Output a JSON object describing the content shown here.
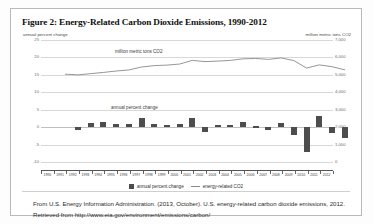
{
  "figure": {
    "title": "Figure 2: Energy-Related Carbon Dioxide Emissions, 1990-2012",
    "left_axis_caption": "annual percent change",
    "right_axis_caption": "million metric tons CO2",
    "caption": "From U.S. Energy Information Administration. (2013, October). U.S. energy-related carbon dioxide emissions, 2012. Retrieved from http://www.eia.gov/environment/emissions/carbon/",
    "colors": {
      "bar": "#4d4d4d",
      "line": "#8a8a8a",
      "grid": "#d8d8d8",
      "border": "#b9b9b9",
      "text": "#2b2b2b"
    }
  },
  "legend": {
    "items": [
      {
        "label": "annual percent change",
        "marker": "bar-swatch"
      },
      {
        "label": "energy-related CO2",
        "marker": "line-swatch"
      }
    ]
  },
  "annotations": {
    "line_series_label": "million metric tons CO2",
    "bar_series_label": "annual percent change"
  },
  "chart_data": {
    "type": "bar",
    "title": "Figure 2: Energy-Related Carbon Dioxide Emissions, 1990-2012",
    "xlabel": "",
    "ylabel": "annual percent change",
    "y2label": "million metric tons CO2",
    "grid": true,
    "legend_position": "bottom",
    "categories": [
      "1990",
      "1991",
      "1992",
      "1993",
      "1994",
      "1995",
      "1996",
      "1997",
      "1998",
      "1999",
      "2000",
      "2001",
      "2002",
      "2003",
      "2004",
      "2005",
      "2006",
      "2007",
      "2008",
      "2009",
      "2010",
      "2011",
      "2012"
    ],
    "ylim": [
      -10,
      25
    ],
    "yticks": [
      25,
      20,
      15,
      10,
      5,
      0,
      -5,
      -10
    ],
    "ytick_labels": [
      "25",
      "20",
      "15",
      "10",
      "5",
      "0",
      "-5",
      "-10"
    ],
    "y2lim": [
      0,
      7000
    ],
    "y2ticks": [
      7000,
      6000,
      5000,
      4000,
      3000,
      2000,
      1000,
      0
    ],
    "y2tick_labels": [
      "7,000",
      "6,000",
      "5,000",
      "4,000",
      "3,000",
      "2,000",
      "1,000",
      "0"
    ],
    "series": [
      {
        "name": "annual percent change",
        "type": "bar",
        "axis": "left",
        "color": "#4d4d4d",
        "values": [
          0.0,
          -0.7,
          1.3,
          1.4,
          1.0,
          0.9,
          2.6,
          1.0,
          0.7,
          0.9,
          2.7,
          -1.3,
          0.6,
          0.7,
          1.4,
          0.2,
          -0.9,
          1.2,
          -2.3,
          -7.1,
          3.2,
          -1.6,
          -3.0
        ]
      },
      {
        "name": "energy-related CO2",
        "type": "line",
        "axis": "right",
        "color": "#8a8a8a",
        "values": [
          5040,
          5000,
          5070,
          5140,
          5220,
          5280,
          5450,
          5530,
          5560,
          5620,
          5830,
          5760,
          5790,
          5830,
          5920,
          5940,
          5890,
          5970,
          5820,
          5390,
          5570,
          5470,
          5290
        ]
      }
    ]
  }
}
